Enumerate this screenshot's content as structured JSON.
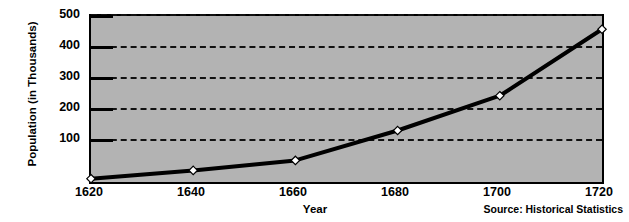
{
  "chart_data": {
    "type": "line",
    "title": "",
    "xlabel": "Year",
    "ylabel": "Population (in Thousands)",
    "x": [
      1620,
      1640,
      1660,
      1680,
      1700,
      1720
    ],
    "values": [
      10,
      35,
      65,
      155,
      260,
      460
    ],
    "series": [
      {
        "name": "Population",
        "values": [
          10,
          35,
          65,
          155,
          260,
          460
        ]
      }
    ],
    "xtick_labels": [
      "1620",
      "1640",
      "1660",
      "1680",
      "1700",
      "1720"
    ],
    "ytick_labels": [
      "100",
      "200",
      "300",
      "400",
      "500"
    ],
    "ytick_values": [
      100,
      200,
      300,
      400,
      500
    ],
    "xlim": [
      1620,
      1720
    ],
    "ylim": [
      0,
      500
    ],
    "grid": "horizontal-dashed",
    "legend": "none",
    "marker": "white-diamond",
    "line_color": "#000000",
    "plot_background": "#b3b3b3",
    "page_background": "#ffffff",
    "annotations": [
      {
        "id": "source",
        "text": "Source: Historical Statistics"
      }
    ]
  },
  "footer": {
    "source_note": "Source: Historical Statistics"
  }
}
